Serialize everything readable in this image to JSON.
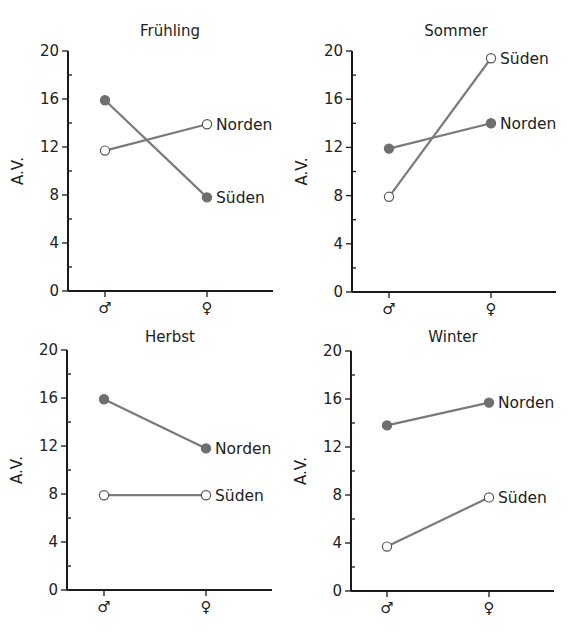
{
  "chart_data": [
    {
      "type": "line",
      "title": "Frühling",
      "xlabel": "",
      "ylabel": "A.V.",
      "categories": [
        "♂",
        "♀"
      ],
      "ylim": [
        0,
        20
      ],
      "yticks": [
        0,
        4,
        8,
        12,
        16,
        20
      ],
      "grid": false,
      "series": [
        {
          "name": "Norden",
          "marker": "open",
          "values": [
            11.7,
            13.9
          ]
        },
        {
          "name": "Süden",
          "marker": "filled",
          "values": [
            15.9,
            7.8
          ]
        }
      ]
    },
    {
      "type": "line",
      "title": "Sommer",
      "xlabel": "",
      "ylabel": "A.V.",
      "categories": [
        "♂",
        "♀"
      ],
      "ylim": [
        0,
        20
      ],
      "yticks": [
        0,
        4,
        8,
        12,
        16,
        20
      ],
      "grid": false,
      "series": [
        {
          "name": "Süden",
          "marker": "open",
          "values": [
            7.9,
            19.4
          ]
        },
        {
          "name": "Norden",
          "marker": "filled",
          "values": [
            11.9,
            14.0
          ]
        }
      ]
    },
    {
      "type": "line",
      "title": "Herbst",
      "xlabel": "",
      "ylabel": "A.V.",
      "categories": [
        "♂",
        "♀"
      ],
      "ylim": [
        0,
        20
      ],
      "yticks": [
        0,
        4,
        8,
        12,
        16,
        20
      ],
      "grid": false,
      "series": [
        {
          "name": "Norden",
          "marker": "filled",
          "values": [
            15.9,
            11.8
          ]
        },
        {
          "name": "Süden",
          "marker": "open",
          "values": [
            7.9,
            7.9
          ]
        }
      ]
    },
    {
      "type": "line",
      "title": "Winter",
      "xlabel": "",
      "ylabel": "A.V.",
      "categories": [
        "♂",
        "♀"
      ],
      "ylim": [
        0,
        20
      ],
      "yticks": [
        0,
        4,
        8,
        12,
        16,
        20
      ],
      "grid": false,
      "series": [
        {
          "name": "Norden",
          "marker": "filled",
          "values": [
            13.8,
            15.7
          ]
        },
        {
          "name": "Süden",
          "marker": "open",
          "values": [
            3.7,
            7.8
          ]
        }
      ]
    }
  ],
  "colors": {
    "line": "#7a7a7a",
    "marker_fill": "#6e6e6e",
    "axis": "#1a1a1a"
  }
}
